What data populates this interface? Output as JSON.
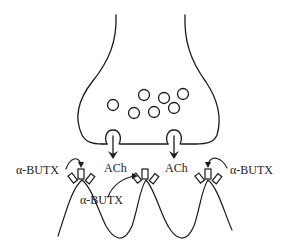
{
  "diagram": {
    "structures": {
      "presynaptic_terminal": "nerve terminal",
      "vesicles": 7,
      "release_sites": 2,
      "receptors": 3,
      "postsynaptic_folds": "postsynaptic membrane"
    },
    "labels": {
      "ach_left": "ACh",
      "ach_right": "ACh",
      "butx_left": "α-BUTX",
      "butx_middle": "α-BUTX",
      "butx_right": "α-BUTX"
    },
    "colors": {
      "stroke": "#1a1a1a",
      "background": "#ffffff"
    }
  }
}
